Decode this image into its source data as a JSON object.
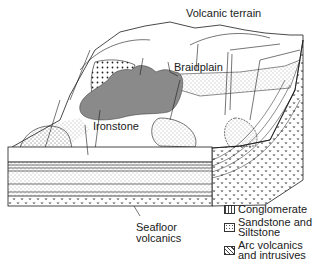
{
  "diagram": {
    "type": "geological block diagram",
    "labels": {
      "volcanic_terrain": "Volcanic terrain",
      "braidplain": "Braidplain",
      "ironstone": "Ironstone",
      "seafloor_volcanics_line1": "Seafloor",
      "seafloor_volcanics_line2": "volcanics"
    },
    "legend": [
      {
        "pattern": "conglomerate",
        "line1": "Conglomerate",
        "line2": ""
      },
      {
        "pattern": "sandstone",
        "line1": "Sandstone and",
        "line2": "Siltstone"
      },
      {
        "pattern": "arc-volcanics",
        "line1": "Arc volcanics",
        "line2": "and intrusives"
      }
    ],
    "colors": {
      "ironstone_fill": "#8a8a8a",
      "line": "#1a1a1a",
      "background": "#ffffff"
    }
  }
}
